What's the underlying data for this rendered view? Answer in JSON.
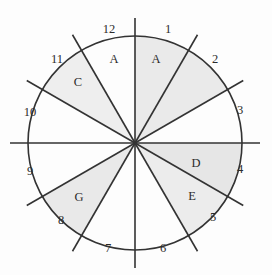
{
  "figure": {
    "background_color": "#fdfdfd",
    "line_color": "#333333",
    "circle": {
      "cx": 135,
      "cy": 143,
      "r": 107
    },
    "axis_overhang": 18
  },
  "chart_data": {
    "type": "pie",
    "xlabel": "",
    "ylabel": "",
    "legend": "none",
    "grid": false,
    "categories": [
      "1",
      "2",
      "3",
      "4",
      "5",
      "6",
      "7",
      "8",
      "9",
      "10",
      "11",
      "12"
    ],
    "values": [
      30,
      30,
      30,
      30,
      30,
      30,
      30,
      30,
      30,
      30,
      30,
      30
    ],
    "note": "Twelve equal 30-degree sectors formed by six diameters; six sectors are shaded and lettered",
    "shaded_sectors": [
      {
        "label": "A",
        "hour_from": 12,
        "hour_to": 1,
        "fill": "#eaeaea"
      },
      {
        "label": "A",
        "hour_from": 1,
        "hour_to": 2,
        "fill": "#eaeaea"
      },
      {
        "label": "C",
        "hour_from": 10,
        "hour_to": 11,
        "fill": "#eeeeee"
      },
      {
        "label": "D",
        "hour_from": 3,
        "hour_to": 4,
        "fill": "#e6e6e6"
      },
      {
        "label": "E",
        "hour_from": 4,
        "hour_to": 5,
        "fill": "#ececec"
      },
      {
        "label": "G",
        "hour_from": 7,
        "hour_to": 8,
        "fill": "#e9e9e9"
      }
    ]
  },
  "hour_marks": [
    {
      "number": "1",
      "x": 168,
      "y": 30
    },
    {
      "number": "2",
      "x": 215,
      "y": 60
    },
    {
      "number": "3",
      "x": 240,
      "y": 111
    },
    {
      "number": "4",
      "x": 240,
      "y": 170
    },
    {
      "number": "5",
      "x": 213,
      "y": 218
    },
    {
      "number": "6",
      "x": 163,
      "y": 249
    },
    {
      "number": "7",
      "x": 108,
      "y": 249
    },
    {
      "number": "8",
      "x": 61,
      "y": 221
    },
    {
      "number": "9",
      "x": 30,
      "y": 172
    },
    {
      "number": "10",
      "x": 30,
      "y": 113
    },
    {
      "number": "11",
      "x": 57,
      "y": 60
    },
    {
      "number": "12",
      "x": 109,
      "y": 30
    }
  ],
  "sector_labels": [
    {
      "letter": "A",
      "x": 114,
      "y": 60
    },
    {
      "letter": "A",
      "x": 156,
      "y": 60
    },
    {
      "letter": "C",
      "x": 78,
      "y": 83
    },
    {
      "letter": "D",
      "x": 196,
      "y": 164
    },
    {
      "letter": "E",
      "x": 192,
      "y": 197
    },
    {
      "letter": "G",
      "x": 79,
      "y": 198
    }
  ]
}
